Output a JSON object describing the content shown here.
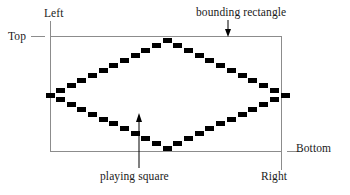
{
  "figure": {
    "background_color": "#ffffff",
    "width": 350,
    "height": 195
  },
  "labels": {
    "left": "Left",
    "top": "Top",
    "bounding_rectangle": "bounding rectangle",
    "bottom": "Bottom",
    "right": "Right",
    "playing_square": "playing square"
  },
  "colors": {
    "ink": "#000000",
    "rule": "#8c8c8c",
    "text": "#1a1a1a"
  },
  "geometry": {
    "bounding_rectangle": {
      "x": 50,
      "y": 36,
      "width": 232,
      "height": 116
    },
    "diamond_vertices": {
      "top": [
        167,
        40
      ],
      "left": [
        50,
        95
      ],
      "right": [
        285,
        95
      ],
      "bottom": [
        167,
        148
      ]
    },
    "block_width": 9,
    "block_height": 5
  }
}
